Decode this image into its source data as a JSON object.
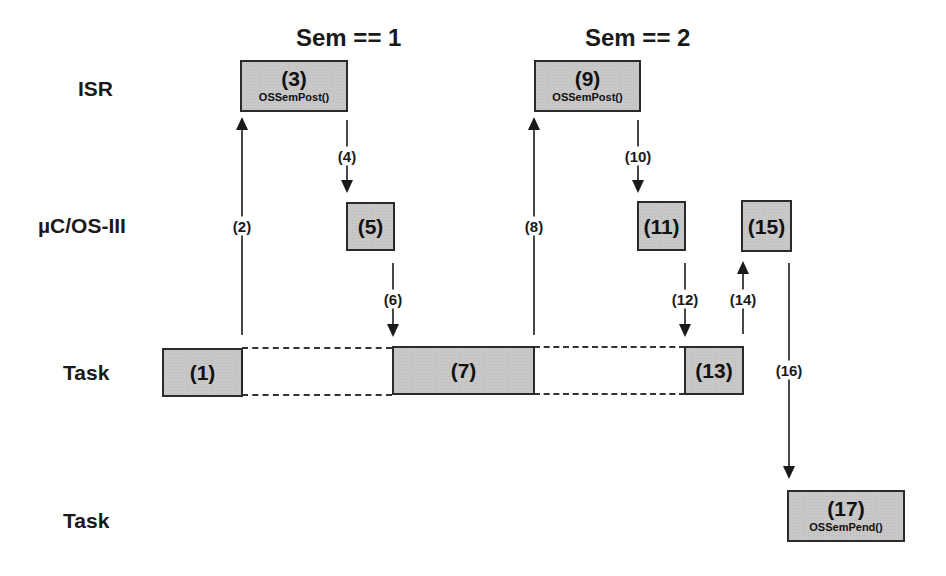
{
  "lanes": {
    "isr": "ISR",
    "kernel": "µC/OS-III",
    "task_a": "Task",
    "task_b": "Task"
  },
  "semaphore_states": {
    "first": "Sem == 1",
    "second": "Sem == 2"
  },
  "boxes": {
    "b1": {
      "num": "(1)"
    },
    "b3": {
      "num": "(3)",
      "fn": "OSSemPost()"
    },
    "b5": {
      "num": "(5)"
    },
    "b7": {
      "num": "(7)"
    },
    "b9": {
      "num": "(9)",
      "fn": "OSSemPost()"
    },
    "b11": {
      "num": "(11)"
    },
    "b13": {
      "num": "(13)"
    },
    "b15": {
      "num": "(15)"
    },
    "b17": {
      "num": "(17)",
      "fn": "OSSemPend()"
    }
  },
  "arrows": {
    "a2": "(2)",
    "a4": "(4)",
    "a6": "(6)",
    "a8": "(8)",
    "a10": "(10)",
    "a12": "(12)",
    "a14": "(14)",
    "a16": "(16)"
  },
  "colors": {
    "box_fill": "#c8c8c8",
    "line": "#1a1a1a"
  }
}
